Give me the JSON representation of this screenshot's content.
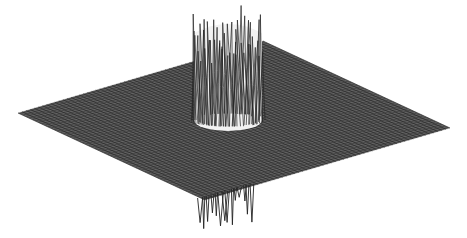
{
  "chart_data": {
    "type": "surface3d",
    "title": "",
    "xlabel": "",
    "ylabel": "",
    "zlabel": "",
    "axes_visible": false,
    "grid": false,
    "legend": null,
    "surface": {
      "plane_corners_px": {
        "left": [
          18,
          113
        ],
        "right": [
          450,
          128
        ],
        "front": [
          205,
          200
        ],
        "back": [
          263,
          41
        ]
      },
      "mesh_color": "#3a3a3a",
      "mesh_rows": 60,
      "mesh_cols": 60
    },
    "spike_region": {
      "shape": "cylinder",
      "center_px": [
        228,
        120
      ],
      "radius_x_px": 34,
      "z_above_max_px": 110,
      "z_below_max_px": 32,
      "line_color": "#222222"
    }
  }
}
